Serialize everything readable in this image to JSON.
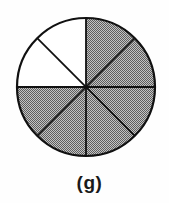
{
  "figure": {
    "caption": "(g)",
    "circle": {
      "center_x": 86,
      "center_y": 87,
      "radius": 69,
      "outline_color": "#111111",
      "outline_width": 2.2,
      "divider_width": 1.8,
      "divider_angles_deg": [
        0,
        45,
        90,
        135
      ]
    },
    "shading": {
      "style": "stipple",
      "dark": "#5e5e5e",
      "light": "#c3c3c3",
      "unshaded": "#ffffff"
    },
    "sectors": [
      {
        "start_deg": 0,
        "end_deg": 45,
        "shaded": true
      },
      {
        "start_deg": 45,
        "end_deg": 90,
        "shaded": true
      },
      {
        "start_deg": 90,
        "end_deg": 135,
        "shaded": true
      },
      {
        "start_deg": 135,
        "end_deg": 180,
        "shaded": true
      },
      {
        "start_deg": 180,
        "end_deg": 225,
        "shaded": false
      },
      {
        "start_deg": 225,
        "end_deg": 270,
        "shaded": false
      },
      {
        "start_deg": 270,
        "end_deg": 315,
        "shaded": true
      },
      {
        "start_deg": 315,
        "end_deg": 360,
        "shaded": true
      }
    ]
  },
  "chart_data": {
    "type": "pie",
    "title": "(g)",
    "categories": [
      "sector-1",
      "sector-2",
      "sector-3",
      "sector-4",
      "sector-5",
      "sector-6",
      "sector-7",
      "sector-8"
    ],
    "values": [
      1,
      1,
      1,
      1,
      1,
      1,
      1,
      1
    ],
    "shaded_flags": [
      true,
      true,
      true,
      true,
      false,
      false,
      true,
      true
    ],
    "total_equal_parts": 8,
    "shaded_parts": 6,
    "unshaded_parts": 2,
    "shaded_fraction": "6/8",
    "legend": "off"
  }
}
